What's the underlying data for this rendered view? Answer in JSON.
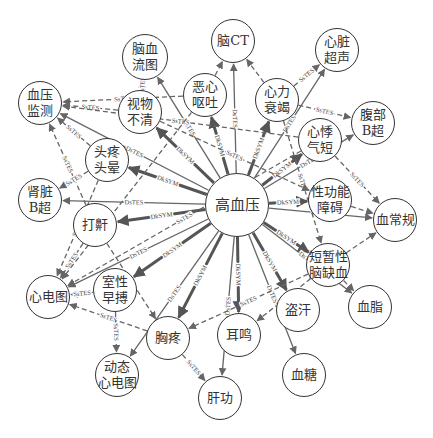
{
  "diagram": {
    "center_node": {
      "id": "gxy",
      "label": "高血压",
      "x": 237,
      "y": 205,
      "r": 32
    },
    "nodes": [
      {
        "id": "nxlt",
        "label": "脑血\n流图",
        "x": 145,
        "y": 57,
        "r": 23
      },
      {
        "id": "nct",
        "label": "脑CT",
        "x": 233,
        "y": 41,
        "r": 22
      },
      {
        "id": "xzcs",
        "label": "心脏\n超声",
        "x": 337,
        "y": 50,
        "r": 22
      },
      {
        "id": "exot",
        "label": "恶心\n呕吐",
        "x": 205,
        "y": 95,
        "r": 22
      },
      {
        "id": "xlsj",
        "label": "心力\n衰竭",
        "x": 277,
        "y": 100,
        "r": 22
      },
      {
        "id": "xyjc",
        "label": "血压\n监测",
        "x": 40,
        "y": 103,
        "r": 22
      },
      {
        "id": "swbq",
        "label": "视物\n不清",
        "x": 140,
        "y": 112,
        "r": 22
      },
      {
        "id": "fbbc",
        "label": "腹部\nB超",
        "x": 373,
        "y": 123,
        "r": 22
      },
      {
        "id": "xjqd",
        "label": "心悸\n气短",
        "x": 320,
        "y": 140,
        "r": 22
      },
      {
        "id": "ttty",
        "label": "头疼\n头晕",
        "x": 107,
        "y": 160,
        "r": 22
      },
      {
        "id": "szbc",
        "label": "肾脏\nB超",
        "x": 40,
        "y": 200,
        "r": 22
      },
      {
        "id": "dh",
        "label": "打鼾",
        "x": 95,
        "y": 225,
        "r": 22
      },
      {
        "id": "xgnza",
        "label": "性功能\n障碍",
        "x": 330,
        "y": 200,
        "r": 22
      },
      {
        "id": "xcg",
        "label": "血常规",
        "x": 395,
        "y": 220,
        "r": 22
      },
      {
        "id": "dzxnqx",
        "label": "短暂性\n脑缺血",
        "x": 328,
        "y": 265,
        "r": 22
      },
      {
        "id": "xz",
        "label": "血脂",
        "x": 370,
        "y": 307,
        "r": 22
      },
      {
        "id": "xdt",
        "label": "心电图",
        "x": 48,
        "y": 297,
        "r": 22
      },
      {
        "id": "sxzb",
        "label": "室性\n早搏",
        "x": 115,
        "y": 290,
        "r": 22
      },
      {
        "id": "xt",
        "label": "胸疼",
        "x": 168,
        "y": 338,
        "r": 22
      },
      {
        "id": "em",
        "label": "耳鸣",
        "x": 239,
        "y": 335,
        "r": 22
      },
      {
        "id": "dh2",
        "label": "盗汗",
        "x": 298,
        "y": 310,
        "r": 22
      },
      {
        "id": "dtxdt",
        "label": "动态\n心电图",
        "x": 117,
        "y": 375,
        "r": 22
      },
      {
        "id": "gg",
        "label": "肝功",
        "x": 220,
        "y": 398,
        "r": 22
      },
      {
        "id": "xt2",
        "label": "血糖",
        "x": 304,
        "y": 375,
        "r": 22
      }
    ],
    "edges": [
      {
        "from": "gxy",
        "to": "swbq",
        "label": "DkSYM",
        "style": "thick"
      },
      {
        "from": "gxy",
        "to": "exot",
        "label": "DkSYM",
        "style": "thick"
      },
      {
        "from": "gxy",
        "to": "xlsj",
        "label": "DkSYM",
        "style": "thick"
      },
      {
        "from": "gxy",
        "to": "xjqd",
        "label": "DkSYM",
        "style": "thick"
      },
      {
        "from": "gxy",
        "to": "ttty",
        "label": "DkSYM",
        "style": "thick"
      },
      {
        "from": "gxy",
        "to": "dh",
        "label": "DkSYM",
        "style": "thick"
      },
      {
        "from": "gxy",
        "to": "xgnza",
        "label": "DkSYM",
        "style": "thick"
      },
      {
        "from": "gxy",
        "to": "dzxnqx",
        "label": "DkSYM",
        "style": "thick"
      },
      {
        "from": "gxy",
        "to": "sxzb",
        "label": "DkSYM",
        "style": "thick"
      },
      {
        "from": "gxy",
        "to": "xt",
        "label": "DkSYM",
        "style": "thick"
      },
      {
        "from": "gxy",
        "to": "em",
        "label": "DkSYM",
        "style": "thick"
      },
      {
        "from": "gxy",
        "to": "dh2",
        "label": "DkSYM",
        "style": "thick"
      },
      {
        "from": "gxy",
        "to": "nxlt",
        "label": "DsTES",
        "style": "solid"
      },
      {
        "from": "gxy",
        "to": "nct",
        "label": "DsTES",
        "style": "solid"
      },
      {
        "from": "gxy",
        "to": "xzcs",
        "label": "DsTES",
        "style": "solid"
      },
      {
        "from": "gxy",
        "to": "fbbc",
        "label": "DsTES",
        "style": "solid"
      },
      {
        "from": "gxy",
        "to": "szbc",
        "label": "DsTES",
        "style": "solid"
      },
      {
        "from": "gxy",
        "to": "xcg",
        "label": "DsTES",
        "style": "solid"
      },
      {
        "from": "gxy",
        "to": "xz",
        "label": "DsTES",
        "style": "solid"
      },
      {
        "from": "gxy",
        "to": "xdt",
        "label": "DsTES",
        "style": "solid"
      },
      {
        "from": "gxy",
        "to": "dtxdt",
        "label": "DsTES",
        "style": "solid"
      },
      {
        "from": "gxy",
        "to": "gg",
        "label": "DsTES",
        "style": "solid"
      },
      {
        "from": "gxy",
        "to": "xt2",
        "label": "DsTES",
        "style": "solid"
      },
      {
        "from": "gxy",
        "to": "xyjc",
        "label": "DsTES",
        "style": "solid"
      },
      {
        "from": "swbq",
        "to": "xyjc",
        "label": "SsTES",
        "style": "dashed"
      },
      {
        "from": "exot",
        "to": "xyjc",
        "label": "SsTES",
        "style": "dashed"
      },
      {
        "from": "ttty",
        "to": "xyjc",
        "label": "SsTES",
        "style": "dashed"
      },
      {
        "from": "dh",
        "to": "xyjc",
        "label": "SsTES",
        "style": "dashed"
      },
      {
        "from": "xjqd",
        "to": "xyjc",
        "label": "SsTES",
        "style": "dashed"
      },
      {
        "from": "swbq",
        "to": "nxlt",
        "label": "SsTES",
        "style": "dashed"
      },
      {
        "from": "exot",
        "to": "nct",
        "label": "",
        "style": "dashed"
      },
      {
        "from": "xlsj",
        "to": "nct",
        "label": "",
        "style": "dashed"
      },
      {
        "from": "xlsj",
        "to": "xzcs",
        "label": "SsTES",
        "style": "dashed"
      },
      {
        "from": "xlsj",
        "to": "fbbc",
        "label": "SsTES",
        "style": "dashed"
      },
      {
        "from": "xjqd",
        "to": "xcg",
        "label": "SsTES",
        "style": "dashed"
      },
      {
        "from": "xgnza",
        "to": "xcg",
        "label": "",
        "style": "dashed"
      },
      {
        "from": "dzxnqx",
        "to": "xcg",
        "label": "",
        "style": "dashed"
      },
      {
        "from": "dzxnqx",
        "to": "xz",
        "label": "",
        "style": "dashed"
      },
      {
        "from": "ttty",
        "to": "szbc",
        "label": "SsTES",
        "style": "dashed"
      },
      {
        "from": "dh",
        "to": "xdt",
        "label": "SsTES",
        "style": "dashed"
      },
      {
        "from": "ttty",
        "to": "xdt",
        "label": "SsTES",
        "style": "dashed"
      },
      {
        "from": "sxzb",
        "to": "xdt",
        "label": "SsTES",
        "style": "dashed"
      },
      {
        "from": "xt",
        "to": "xdt",
        "label": "SsTES",
        "style": "dashed"
      },
      {
        "from": "xjqd",
        "to": "xdt",
        "label": "SsTES",
        "style": "dashed"
      },
      {
        "from": "sxzb",
        "to": "dtxdt",
        "label": "SsTES",
        "style": "dashed"
      },
      {
        "from": "xt",
        "to": "gg",
        "label": "SsTES",
        "style": "dashed"
      },
      {
        "from": "dzxnqx",
        "to": "xt",
        "label": "SsTES",
        "style": "dashed"
      },
      {
        "from": "xlsj",
        "to": "dzxnqx",
        "label": "SsTES",
        "style": "dashed"
      },
      {
        "from": "swbq",
        "to": "xgnza",
        "label": "SsTES",
        "style": "dashed"
      },
      {
        "from": "dh",
        "to": "xt",
        "label": "",
        "style": "dashed"
      },
      {
        "from": "exot",
        "to": "xdt",
        "label": "",
        "style": "dashed"
      },
      {
        "from": "dzxnqx",
        "to": "em",
        "label": "SsTES",
        "style": "dashed"
      }
    ],
    "edge_colors": {
      "thick": "#555555",
      "solid": "#666666",
      "dashed": "#666666"
    },
    "node_border_color": "#333333"
  }
}
